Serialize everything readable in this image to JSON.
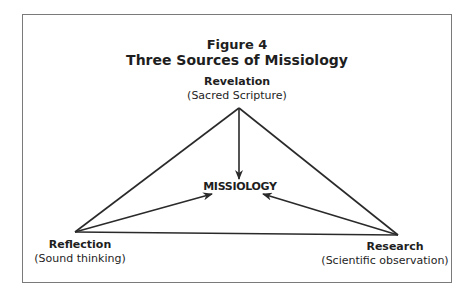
{
  "figure": {
    "number": "Figure 4",
    "title": "Three Sources of Missiology"
  },
  "nodes": {
    "top": {
      "label": "Revelation",
      "sublabel": "(Sacred Scripture)"
    },
    "center": {
      "label": "MISSIOLOGY"
    },
    "left": {
      "label": "Reflection",
      "sublabel": "(Sound thinking)"
    },
    "right": {
      "label": "Research",
      "sublabel": "(Scientific observation)"
    }
  },
  "colors": {
    "line": "#2a2a2a",
    "frame": "#7a7a7a",
    "background": "#ffffff"
  }
}
